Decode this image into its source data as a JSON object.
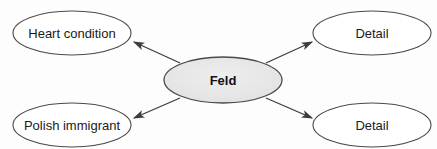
{
  "diagram": {
    "type": "concept-map",
    "background_color": "#fdfdfd",
    "center_node": {
      "id": "feld",
      "label": "Feld",
      "shape": "ellipse",
      "fill_color": "#e4e4e4",
      "stroke_color": "#4a4a4a",
      "text_color": "#111111",
      "bold": true,
      "cx": 223,
      "cy": 80,
      "rx": 59,
      "ry": 23
    },
    "outer_nodes": [
      {
        "id": "heart-condition",
        "label": "Heart condition",
        "shape": "ellipse",
        "fill_color": "#ffffff",
        "stroke_color": "#4a4a4a",
        "text_color": "#1a1a1a",
        "position": "top-left",
        "cx": 72,
        "cy": 33,
        "rx": 59,
        "ry": 22
      },
      {
        "id": "detail-top-right",
        "label": "Detail",
        "shape": "ellipse",
        "fill_color": "#ffffff",
        "stroke_color": "#4a4a4a",
        "text_color": "#1a1a1a",
        "position": "top-right",
        "cx": 372,
        "cy": 33,
        "rx": 59,
        "ry": 22
      },
      {
        "id": "polish-immigrant",
        "label": "Polish immigrant",
        "shape": "ellipse",
        "fill_color": "#ffffff",
        "stroke_color": "#4a4a4a",
        "text_color": "#1a1a1a",
        "position": "bottom-left",
        "cx": 72,
        "cy": 125,
        "rx": 59,
        "ry": 22
      },
      {
        "id": "detail-bottom-right",
        "label": "Detail",
        "shape": "ellipse",
        "fill_color": "#ffffff",
        "stroke_color": "#4a4a4a",
        "text_color": "#1a1a1a",
        "position": "bottom-right",
        "cx": 372,
        "cy": 125,
        "rx": 59,
        "ry": 22
      }
    ],
    "edges": [
      {
        "id": "feld-to-heart-condition",
        "from": "feld",
        "to": "heart-condition",
        "arrowhead": "target",
        "direction": "up-left",
        "x1": 180,
        "y1": 63,
        "x2": 134,
        "y2": 42
      },
      {
        "id": "feld-to-detail-top-right",
        "from": "feld",
        "to": "detail-top-right",
        "arrowhead": "target",
        "direction": "up-right",
        "x1": 266,
        "y1": 63,
        "x2": 312,
        "y2": 42
      },
      {
        "id": "feld-to-polish-immigrant",
        "from": "feld",
        "to": "polish-immigrant",
        "arrowhead": "target",
        "direction": "down-left",
        "x1": 180,
        "y1": 98,
        "x2": 134,
        "y2": 118
      },
      {
        "id": "feld-to-detail-bottom-right",
        "from": "feld",
        "to": "detail-bottom-right",
        "arrowhead": "target",
        "direction": "down-right",
        "x1": 266,
        "y1": 98,
        "x2": 312,
        "y2": 118
      }
    ]
  }
}
